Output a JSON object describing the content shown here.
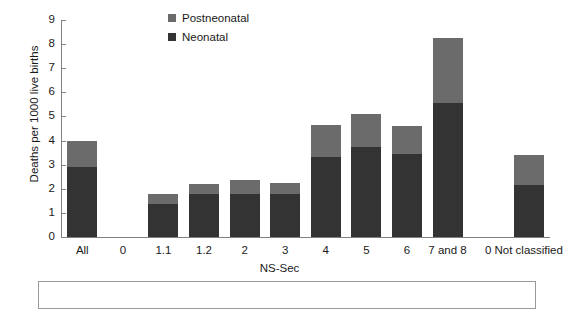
{
  "chart_data": {
    "type": "bar",
    "title": "",
    "subtitle": "",
    "xlabel": "NS-Sec",
    "ylabel": "Deaths per 1000 live births",
    "ylim": [
      0,
      9
    ],
    "yticks": [
      0,
      1,
      2,
      3,
      4,
      5,
      6,
      7,
      8,
      9
    ],
    "grid": false,
    "stacked": true,
    "legend_position": "top-center",
    "categories": [
      "All",
      "0",
      "1.1",
      "1.2",
      "2",
      "3",
      "4",
      "5",
      "6",
      "7 and 8",
      "0",
      "Not classified"
    ],
    "series": [
      {
        "name": "Neonatal",
        "color": "#333333",
        "values": [
          2.9,
          null,
          1.35,
          1.8,
          1.8,
          1.8,
          3.3,
          3.75,
          3.45,
          5.55,
          null,
          2.15
        ]
      },
      {
        "name": "Postneonatal",
        "color": "#6b6b6b",
        "values": [
          1.1,
          null,
          0.45,
          0.4,
          0.55,
          0.45,
          1.35,
          1.35,
          1.15,
          2.7,
          null,
          1.25
        ]
      }
    ],
    "totals": [
      4.0,
      null,
      1.8,
      2.2,
      2.35,
      2.25,
      4.65,
      5.1,
      4.6,
      8.25,
      null,
      3.4
    ]
  },
  "legend": {
    "entries": [
      {
        "label": "Postneonatal",
        "color": "#6b6b6b"
      },
      {
        "label": "Neonatal",
        "color": "#333333"
      }
    ]
  },
  "axes": {
    "y_title": "Deaths per 1000 live births",
    "x_title": "NS-Sec",
    "y_labels": [
      "9",
      "8",
      "7",
      "6",
      "5",
      "4",
      "3",
      "2",
      "1",
      "0"
    ],
    "x_labels": [
      "All",
      "0",
      "1.1",
      "1.2",
      "2",
      "3",
      "4",
      "5",
      "6",
      "7 and 8",
      "0",
      "Not classified"
    ]
  },
  "note_box": {
    "text": ""
  }
}
